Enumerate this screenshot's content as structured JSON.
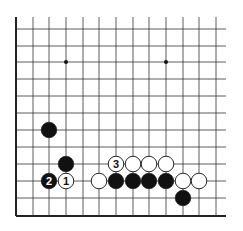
{
  "diagram": {
    "type": "go-board-fragment",
    "grid": {
      "x_lines": [
        16,
        33,
        49,
        66,
        83,
        99,
        116,
        133,
        149,
        166,
        183,
        199,
        216
      ],
      "y_lines": [
        29,
        46,
        62,
        79,
        96,
        113,
        130,
        147,
        164,
        181,
        198,
        216
      ],
      "vertical_top": 17,
      "horizontal_right": 226,
      "left_edge_x": 16,
      "bottom_edge_y": 216,
      "line_color": "#333333",
      "edge_color": "#222222"
    },
    "hoshi": [
      {
        "col": 3,
        "row": 2
      },
      {
        "col": 9,
        "row": 2
      }
    ],
    "stones": [
      {
        "color": "black",
        "col": 2,
        "row": 6,
        "label": ""
      },
      {
        "color": "black",
        "col": 3,
        "row": 8,
        "label": ""
      },
      {
        "color": "black",
        "col": 2,
        "row": 9,
        "label": "2"
      },
      {
        "color": "white",
        "col": 3,
        "row": 9,
        "label": "1"
      },
      {
        "color": "white",
        "col": 6,
        "row": 8,
        "label": "3"
      },
      {
        "color": "white",
        "col": 7,
        "row": 8,
        "label": ""
      },
      {
        "color": "white",
        "col": 8,
        "row": 8,
        "label": ""
      },
      {
        "color": "white",
        "col": 9,
        "row": 8,
        "label": ""
      },
      {
        "color": "white",
        "col": 5,
        "row": 9,
        "label": ""
      },
      {
        "color": "black",
        "col": 6,
        "row": 9,
        "label": ""
      },
      {
        "color": "black",
        "col": 7,
        "row": 9,
        "label": ""
      },
      {
        "color": "black",
        "col": 8,
        "row": 9,
        "label": ""
      },
      {
        "color": "black",
        "col": 9,
        "row": 9,
        "label": ""
      },
      {
        "color": "white",
        "col": 10,
        "row": 9,
        "label": ""
      },
      {
        "color": "white",
        "col": 11,
        "row": 9,
        "label": ""
      },
      {
        "color": "black",
        "col": 10,
        "row": 10,
        "label": ""
      }
    ],
    "move_labels": [
      "1",
      "2",
      "3"
    ]
  }
}
